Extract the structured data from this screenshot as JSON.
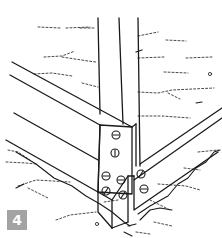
{
  "illustration": {
    "subject": "wooden frame corner joint fastened with screws",
    "step_badge": {
      "label": "4",
      "color": "#a3a3a3",
      "text_color": "#ffffff"
    },
    "line_color": "#1a1a1a",
    "background": "#ffffff"
  }
}
